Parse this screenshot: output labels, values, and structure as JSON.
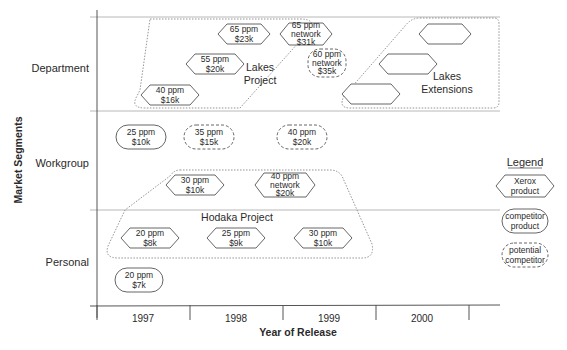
{
  "axes": {
    "y_title": "Market Segments",
    "x_title": "Year of Release",
    "segments": [
      "Department",
      "Workgroup",
      "Personal"
    ],
    "years": [
      "1997",
      "1998",
      "1999",
      "2000"
    ]
  },
  "groups": [
    {
      "id": "lakes",
      "label": [
        "Lakes",
        "Project"
      ]
    },
    {
      "id": "lakes-ext",
      "label": [
        "Lakes",
        "Extensions"
      ]
    },
    {
      "id": "hodaka",
      "label": [
        "Hodaka Project"
      ]
    }
  ],
  "products": [
    {
      "type": "xerox",
      "segment": "Department",
      "lines": [
        "65 ppm",
        "$23k"
      ]
    },
    {
      "type": "xerox",
      "segment": "Department",
      "lines": [
        "65 ppm",
        "network",
        "$31k"
      ]
    },
    {
      "type": "xerox",
      "segment": "Department",
      "lines": [
        "55 ppm",
        "$20k"
      ]
    },
    {
      "type": "xerox",
      "segment": "Department",
      "lines": [
        "40 ppm",
        "$16k"
      ]
    },
    {
      "type": "potential",
      "segment": "Department",
      "lines": [
        "60 ppm",
        "network",
        "$35k"
      ]
    },
    {
      "type": "xerox",
      "segment": "Department",
      "lines": []
    },
    {
      "type": "xerox",
      "segment": "Department",
      "lines": []
    },
    {
      "type": "xerox",
      "segment": "Department",
      "lines": []
    },
    {
      "type": "competitor",
      "segment": "Workgroup",
      "lines": [
        "25 ppm",
        "$10k"
      ]
    },
    {
      "type": "potential",
      "segment": "Workgroup",
      "lines": [
        "35 ppm",
        "$15k"
      ]
    },
    {
      "type": "potential",
      "segment": "Workgroup",
      "lines": [
        "40 ppm",
        "$20k"
      ]
    },
    {
      "type": "xerox",
      "segment": "Workgroup",
      "lines": [
        "30 ppm",
        "$10k"
      ]
    },
    {
      "type": "xerox",
      "segment": "Workgroup",
      "lines": [
        "40 ppm",
        "network",
        "$20k"
      ]
    },
    {
      "type": "xerox",
      "segment": "Personal",
      "lines": [
        "20 ppm",
        "$8k"
      ]
    },
    {
      "type": "xerox",
      "segment": "Personal",
      "lines": [
        "25 ppm",
        "$9k"
      ]
    },
    {
      "type": "xerox",
      "segment": "Personal",
      "lines": [
        "30 ppm",
        "$10k"
      ]
    },
    {
      "type": "competitor",
      "segment": "Personal",
      "lines": [
        "20 ppm",
        "$7k"
      ]
    }
  ],
  "legend": {
    "title": "Legend",
    "items": [
      {
        "type": "xerox",
        "lines": [
          "Xerox",
          "product"
        ]
      },
      {
        "type": "competitor",
        "lines": [
          "competitor",
          "product"
        ]
      },
      {
        "type": "potential",
        "lines": [
          "potential",
          "competitor"
        ]
      }
    ]
  },
  "colors": {
    "line": "#555555",
    "grid": "#9a9a9a",
    "text": "#2a2a2a"
  }
}
